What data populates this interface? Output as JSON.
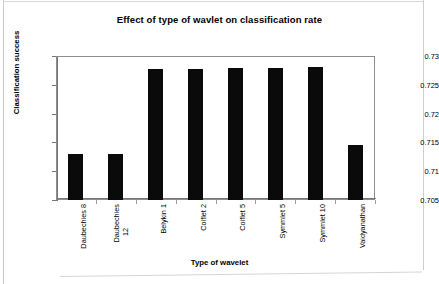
{
  "chart_data": {
    "type": "bar",
    "title": "Effect of type of wavlet on classification rate",
    "xlabel": "Type of wavelet",
    "ylabel": "Classification success",
    "categories": [
      "Daubechies 8",
      "Daubechies 12",
      "Belykin 1",
      "Coiflet 2",
      "Coiflet 5",
      "Symmlet 5",
      "Symmlet 10",
      "Vaidyanathan"
    ],
    "category_lines": [
      [
        "Daubechies 8"
      ],
      [
        "Daubechies",
        "12"
      ],
      [
        "Belykin 1"
      ],
      [
        "Coiflet 2"
      ],
      [
        "Coiflet 5"
      ],
      [
        "Symmlet 5"
      ],
      [
        "Symmlet 10"
      ],
      [
        "Vaidyanathan"
      ]
    ],
    "values": [
      0.713,
      0.713,
      0.7277,
      0.7278,
      0.7279,
      0.728,
      0.7281,
      0.7145
    ],
    "ylim": [
      0.705,
      0.73
    ],
    "yticks": [
      0.705,
      0.71,
      0.715,
      0.72,
      0.725,
      0.73
    ],
    "ytick_labels": [
      "0.705",
      "0.71",
      "0.715",
      "0.72",
      "0.725",
      "0.73"
    ],
    "grid": false,
    "legend": false,
    "bar_color": "#0a0a0a",
    "frame_color": "#8d8d8d"
  },
  "footer": {
    "ghost_text": ""
  }
}
